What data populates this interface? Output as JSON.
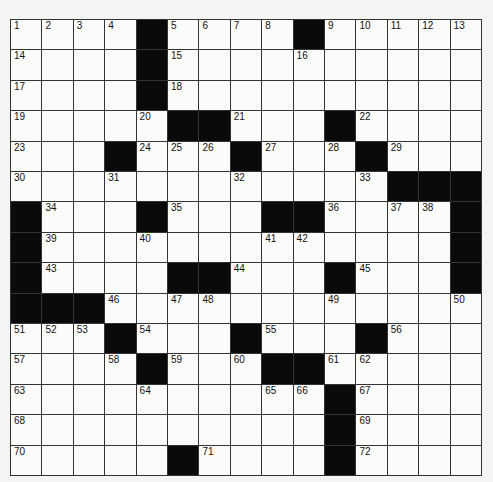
{
  "puzzle": {
    "rows": 15,
    "cols": 15,
    "layout": [
      "....#....#.....",
      "....#..........",
      "....#..........",
      ".....##...#....",
      "...#...#...#...",
      "............###",
      "#...#...##....#",
      "#.............#",
      "#....##...#...#",
      "###............",
      "...#...#...#...",
      "....#...##.....",
      "..........#....",
      "..........#....",
      ".....#....#...."
    ],
    "numbers": [
      {
        "r": 0,
        "c": 0,
        "n": 1
      },
      {
        "r": 0,
        "c": 1,
        "n": 2
      },
      {
        "r": 0,
        "c": 2,
        "n": 3
      },
      {
        "r": 0,
        "c": 3,
        "n": 4
      },
      {
        "r": 0,
        "c": 5,
        "n": 5
      },
      {
        "r": 0,
        "c": 6,
        "n": 6
      },
      {
        "r": 0,
        "c": 7,
        "n": 7
      },
      {
        "r": 0,
        "c": 8,
        "n": 8
      },
      {
        "r": 0,
        "c": 10,
        "n": 9
      },
      {
        "r": 0,
        "c": 11,
        "n": 10
      },
      {
        "r": 0,
        "c": 12,
        "n": 11
      },
      {
        "r": 0,
        "c": 13,
        "n": 12
      },
      {
        "r": 0,
        "c": 14,
        "n": 13
      },
      {
        "r": 1,
        "c": 0,
        "n": 14
      },
      {
        "r": 1,
        "c": 5,
        "n": 15
      },
      {
        "r": 1,
        "c": 9,
        "n": 16
      },
      {
        "r": 2,
        "c": 0,
        "n": 17
      },
      {
        "r": 2,
        "c": 5,
        "n": 18
      },
      {
        "r": 3,
        "c": 0,
        "n": 19
      },
      {
        "r": 3,
        "c": 4,
        "n": 20
      },
      {
        "r": 3,
        "c": 7,
        "n": 21
      },
      {
        "r": 3,
        "c": 11,
        "n": 22
      },
      {
        "r": 4,
        "c": 0,
        "n": 23
      },
      {
        "r": 4,
        "c": 4,
        "n": 24
      },
      {
        "r": 4,
        "c": 5,
        "n": 25
      },
      {
        "r": 4,
        "c": 6,
        "n": 26
      },
      {
        "r": 4,
        "c": 8,
        "n": 27
      },
      {
        "r": 4,
        "c": 10,
        "n": 28
      },
      {
        "r": 4,
        "c": 12,
        "n": 29
      },
      {
        "r": 5,
        "c": 0,
        "n": 30
      },
      {
        "r": 5,
        "c": 3,
        "n": 31
      },
      {
        "r": 5,
        "c": 7,
        "n": 32
      },
      {
        "r": 5,
        "c": 11,
        "n": 33
      },
      {
        "r": 6,
        "c": 1,
        "n": 34
      },
      {
        "r": 6,
        "c": 5,
        "n": 35
      },
      {
        "r": 6,
        "c": 10,
        "n": 36
      },
      {
        "r": 6,
        "c": 12,
        "n": 37
      },
      {
        "r": 6,
        "c": 13,
        "n": 38
      },
      {
        "r": 7,
        "c": 1,
        "n": 39
      },
      {
        "r": 7,
        "c": 4,
        "n": 40
      },
      {
        "r": 7,
        "c": 8,
        "n": 41
      },
      {
        "r": 7,
        "c": 9,
        "n": 42
      },
      {
        "r": 8,
        "c": 1,
        "n": 43
      },
      {
        "r": 8,
        "c": 7,
        "n": 44
      },
      {
        "r": 8,
        "c": 11,
        "n": 45
      },
      {
        "r": 9,
        "c": 3,
        "n": 46
      },
      {
        "r": 9,
        "c": 5,
        "n": 47
      },
      {
        "r": 9,
        "c": 6,
        "n": 48
      },
      {
        "r": 9,
        "c": 10,
        "n": 49
      },
      {
        "r": 9,
        "c": 14,
        "n": 50
      },
      {
        "r": 10,
        "c": 0,
        "n": 51
      },
      {
        "r": 10,
        "c": 1,
        "n": 52
      },
      {
        "r": 10,
        "c": 2,
        "n": 53
      },
      {
        "r": 10,
        "c": 4,
        "n": 54
      },
      {
        "r": 10,
        "c": 8,
        "n": 55
      },
      {
        "r": 10,
        "c": 12,
        "n": 56
      },
      {
        "r": 11,
        "c": 0,
        "n": 57
      },
      {
        "r": 11,
        "c": 3,
        "n": 58
      },
      {
        "r": 11,
        "c": 5,
        "n": 59
      },
      {
        "r": 11,
        "c": 7,
        "n": 60
      },
      {
        "r": 11,
        "c": 10,
        "n": 61
      },
      {
        "r": 11,
        "c": 11,
        "n": 62
      },
      {
        "r": 12,
        "c": 0,
        "n": 63
      },
      {
        "r": 12,
        "c": 4,
        "n": 64
      },
      {
        "r": 12,
        "c": 8,
        "n": 65
      },
      {
        "r": 12,
        "c": 9,
        "n": 66
      },
      {
        "r": 12,
        "c": 11,
        "n": 67
      },
      {
        "r": 13,
        "c": 0,
        "n": 68
      },
      {
        "r": 13,
        "c": 11,
        "n": 69
      },
      {
        "r": 14,
        "c": 0,
        "n": 70
      },
      {
        "r": 14,
        "c": 6,
        "n": 71
      },
      {
        "r": 14,
        "c": 11,
        "n": 72
      }
    ]
  }
}
